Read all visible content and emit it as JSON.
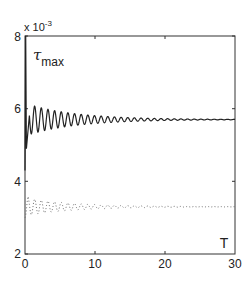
{
  "chart_data": {
    "type": "line",
    "title": "",
    "xlabel": "T",
    "ylabel": "τ_max",
    "ylabel_main": "τ",
    "ylabel_sub": "max",
    "y_multiplier": "x 10",
    "y_multiplier_exp": "-3",
    "xlim": [
      0,
      30
    ],
    "ylim": [
      2,
      8
    ],
    "xticks": [
      0,
      10,
      20,
      30
    ],
    "yticks": [
      2,
      4,
      6,
      8
    ],
    "xtick_labels": [
      "0",
      "10",
      "20",
      "30"
    ],
    "ytick_labels": [
      "2",
      "4",
      "6",
      "8"
    ],
    "grid": false,
    "legend": null,
    "series": [
      {
        "name": "solid",
        "style": "solid",
        "color": "#222222",
        "start_value": 4.3,
        "initial_spike": 8.0,
        "mean": 5.7,
        "initial_amplitude": 0.45,
        "period": 0.95,
        "final_value": 5.7,
        "description": "Damped oscillation settling to ~5.7e-3"
      },
      {
        "name": "dotted",
        "style": "dotted",
        "color": "#555555",
        "start_value": 3.0,
        "mean": 3.3,
        "initial_amplitude": 0.25,
        "period": 0.95,
        "final_value": 3.3,
        "description": "Damped oscillation settling to ~3.3e-3"
      }
    ]
  }
}
